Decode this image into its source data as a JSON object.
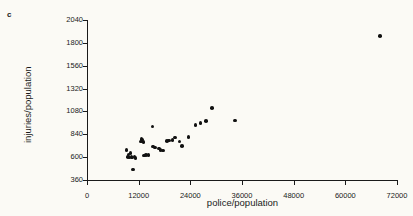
{
  "panel": {
    "label": "c"
  },
  "chart_data": {
    "type": "scatter",
    "title": "",
    "xlabel": "police/population",
    "ylabel": "injuries/population",
    "xlim": [
      0,
      72000
    ],
    "ylim": [
      360,
      2040
    ],
    "xticks": [
      0,
      12000,
      24000,
      36000,
      48000,
      60000,
      72000
    ],
    "yticks": [
      360,
      600,
      840,
      1080,
      1320,
      1560,
      1800,
      2040
    ],
    "xtick_labels": [
      "0",
      "12000",
      "24000",
      "36000",
      "48000",
      "60000",
      "72000"
    ],
    "ytick_labels": [
      "360",
      "600",
      "840",
      "1080",
      "1320",
      "1560",
      "1800",
      "2040"
    ],
    "grid": false,
    "legend": false,
    "marker": "filled-circle",
    "marker_color": "#111111",
    "points": [
      {
        "x": 9200,
        "y": 676
      },
      {
        "x": 9500,
        "y": 600
      },
      {
        "x": 9600,
        "y": 628
      },
      {
        "x": 9900,
        "y": 596
      },
      {
        "x": 10100,
        "y": 646
      },
      {
        "x": 10300,
        "y": 604
      },
      {
        "x": 10600,
        "y": 598
      },
      {
        "x": 10700,
        "y": 470
      },
      {
        "x": 11000,
        "y": 608
      },
      {
        "x": 11300,
        "y": 594
      },
      {
        "x": 12600,
        "y": 764
      },
      {
        "x": 12700,
        "y": 788
      },
      {
        "x": 12900,
        "y": 784
      },
      {
        "x": 13100,
        "y": 758
      },
      {
        "x": 13300,
        "y": 616
      },
      {
        "x": 13700,
        "y": 622
      },
      {
        "x": 14300,
        "y": 622
      },
      {
        "x": 15200,
        "y": 920
      },
      {
        "x": 15300,
        "y": 712
      },
      {
        "x": 15800,
        "y": 700
      },
      {
        "x": 16700,
        "y": 690
      },
      {
        "x": 17100,
        "y": 672
      },
      {
        "x": 17600,
        "y": 668
      },
      {
        "x": 18600,
        "y": 772
      },
      {
        "x": 19000,
        "y": 776
      },
      {
        "x": 19900,
        "y": 780
      },
      {
        "x": 20500,
        "y": 806
      },
      {
        "x": 21500,
        "y": 764
      },
      {
        "x": 22000,
        "y": 716
      },
      {
        "x": 23600,
        "y": 812
      },
      {
        "x": 25200,
        "y": 940
      },
      {
        "x": 26400,
        "y": 958
      },
      {
        "x": 27600,
        "y": 982
      },
      {
        "x": 29000,
        "y": 1118
      },
      {
        "x": 34400,
        "y": 986
      },
      {
        "x": 68000,
        "y": 1872
      }
    ]
  }
}
